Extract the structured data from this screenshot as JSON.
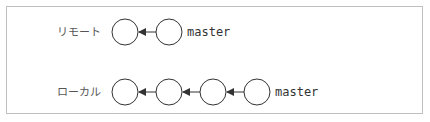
{
  "diagram": {
    "rows": [
      {
        "id": "remote",
        "label": "リモート",
        "branch_label": "master",
        "commit_count": 2
      },
      {
        "id": "local",
        "label": "ローカル",
        "branch_label": "master",
        "commit_count": 4
      }
    ],
    "colors": {
      "border": "#bfbfbf",
      "circle_stroke": "#333333",
      "arrow": "#333333",
      "label": "#555555"
    }
  }
}
